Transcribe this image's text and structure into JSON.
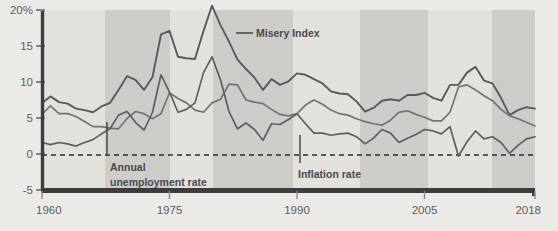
{
  "chart_data": {
    "type": "line",
    "title": "",
    "subtitle": "",
    "xlabel": "",
    "ylabel": "",
    "xlim": [
      1960,
      2018
    ],
    "ylim": [
      -5,
      20
    ],
    "grid": false,
    "legend_position": "inline-annotations",
    "y_ticks": [
      "20%",
      "15",
      "10",
      "5",
      "0",
      "-5"
    ],
    "y_tick_values": [
      20,
      15,
      10,
      5,
      0,
      -5
    ],
    "x_ticks": [
      "1960",
      "1975",
      "1990",
      "2005",
      "2018"
    ],
    "x_tick_values": [
      1960,
      1975,
      1990,
      2005,
      2018
    ],
    "zero_line": 0,
    "x": [
      1960,
      1961,
      1962,
      1963,
      1964,
      1965,
      1966,
      1967,
      1968,
      1969,
      1970,
      1971,
      1972,
      1973,
      1974,
      1975,
      1976,
      1977,
      1978,
      1979,
      1980,
      1981,
      1982,
      1983,
      1984,
      1985,
      1986,
      1987,
      1988,
      1989,
      1990,
      1991,
      1992,
      1993,
      1994,
      1995,
      1996,
      1997,
      1998,
      1999,
      2000,
      2001,
      2002,
      2003,
      2004,
      2005,
      2006,
      2007,
      2008,
      2009,
      2010,
      2011,
      2012,
      2013,
      2014,
      2015,
      2016,
      2017,
      2018
    ],
    "series": [
      {
        "name": "Misery Index",
        "color": "#5a5a5a",
        "values": [
          7.1,
          8.0,
          7.2,
          7.0,
          6.3,
          6.1,
          5.8,
          6.6,
          7.1,
          8.9,
          10.8,
          10.3,
          8.9,
          10.7,
          16.6,
          17.1,
          13.5,
          13.3,
          13.2,
          17.1,
          20.6,
          17.9,
          15.6,
          13.1,
          11.8,
          10.6,
          8.9,
          10.4,
          9.6,
          10.1,
          11.2,
          11.0,
          10.4,
          9.8,
          8.7,
          8.4,
          8.3,
          7.3,
          5.9,
          6.4,
          7.4,
          7.6,
          7.4,
          8.2,
          8.2,
          8.5,
          7.8,
          7.4,
          9.6,
          9.6,
          11.3,
          12.1,
          10.2,
          9.8,
          7.8,
          5.4,
          6.1,
          6.5,
          6.3
        ]
      },
      {
        "name": "Annual unemployment rate",
        "color": "#737373",
        "values": [
          5.5,
          6.7,
          5.6,
          5.6,
          5.2,
          4.5,
          3.8,
          3.8,
          3.6,
          3.5,
          4.9,
          5.9,
          5.6,
          4.9,
          5.6,
          8.5,
          7.7,
          7.1,
          6.1,
          5.8,
          7.1,
          7.6,
          9.7,
          9.6,
          7.5,
          7.2,
          7.0,
          6.2,
          5.5,
          5.3,
          5.6,
          6.8,
          7.5,
          6.9,
          6.1,
          5.6,
          5.4,
          4.9,
          4.5,
          4.2,
          4.0,
          4.7,
          5.8,
          6.0,
          5.5,
          5.1,
          4.6,
          4.6,
          5.8,
          9.3,
          9.6,
          8.9,
          8.1,
          7.4,
          6.2,
          5.3,
          4.9,
          4.4,
          3.9
        ]
      },
      {
        "name": "Inflation rate",
        "color": "#5f5f5f",
        "values": [
          1.6,
          1.3,
          1.6,
          1.4,
          1.1,
          1.6,
          2.0,
          2.8,
          3.5,
          5.4,
          5.9,
          4.4,
          3.3,
          5.8,
          11.0,
          8.6,
          5.8,
          6.2,
          7.1,
          11.3,
          13.5,
          10.3,
          5.9,
          3.5,
          4.3,
          3.4,
          1.9,
          4.2,
          4.1,
          4.8,
          5.6,
          4.2,
          2.9,
          2.9,
          2.6,
          2.8,
          2.9,
          2.4,
          1.4,
          2.2,
          3.4,
          2.9,
          1.6,
          2.2,
          2.7,
          3.4,
          3.2,
          2.8,
          3.8,
          -0.3,
          1.7,
          3.2,
          2.1,
          2.4,
          1.6,
          0.1,
          1.2,
          2.1,
          2.4
        ]
      }
    ],
    "annotations": [
      {
        "name": "misery-index-label",
        "text": "Misery Index",
        "x": 256,
        "y": 33,
        "leader_from": [
          235,
          33
        ],
        "leader_to": [
          252,
          33
        ]
      },
      {
        "name": "annual-unemployment-rate-label",
        "line1": "Annual",
        "line2": "unemployment rate",
        "x": 110,
        "y": 168,
        "leader_x": 107,
        "leader_y1": 121,
        "leader_y2": 156
      },
      {
        "name": "inflation-rate-label",
        "text": "Inflation rate",
        "x": 298,
        "y": 176,
        "leader_x": 300,
        "leader_y1": 134,
        "leader_y2": 163
      }
    ],
    "shaded_bands": [
      {
        "label": "band-1",
        "x0": 105,
        "x1": 170
      },
      {
        "label": "band-2",
        "x0": 213,
        "x1": 293
      },
      {
        "label": "band-3",
        "x0": 360,
        "x1": 428
      },
      {
        "label": "band-4",
        "x0": 492,
        "x1": 535
      }
    ],
    "colors": {
      "page_background": "#eceae6",
      "plot_background": "#e3e1dc",
      "band_fill": "#cdccc8",
      "axis_line": "#3d3d3d",
      "zero_dash": "#2b2b2b",
      "tick_text": "#5d5d5d",
      "annotation_text": "#4a4a4a"
    }
  }
}
